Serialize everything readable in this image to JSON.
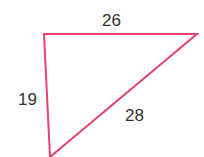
{
  "diagram": {
    "type": "triangle",
    "stroke_color": "#e8416a",
    "vertices": {
      "top_left": [
        44,
        34
      ],
      "top_right": [
        197,
        34
      ],
      "bottom": [
        50,
        157
      ]
    },
    "labels": {
      "top": "26",
      "left": "19",
      "hypotenuse": "28"
    }
  }
}
